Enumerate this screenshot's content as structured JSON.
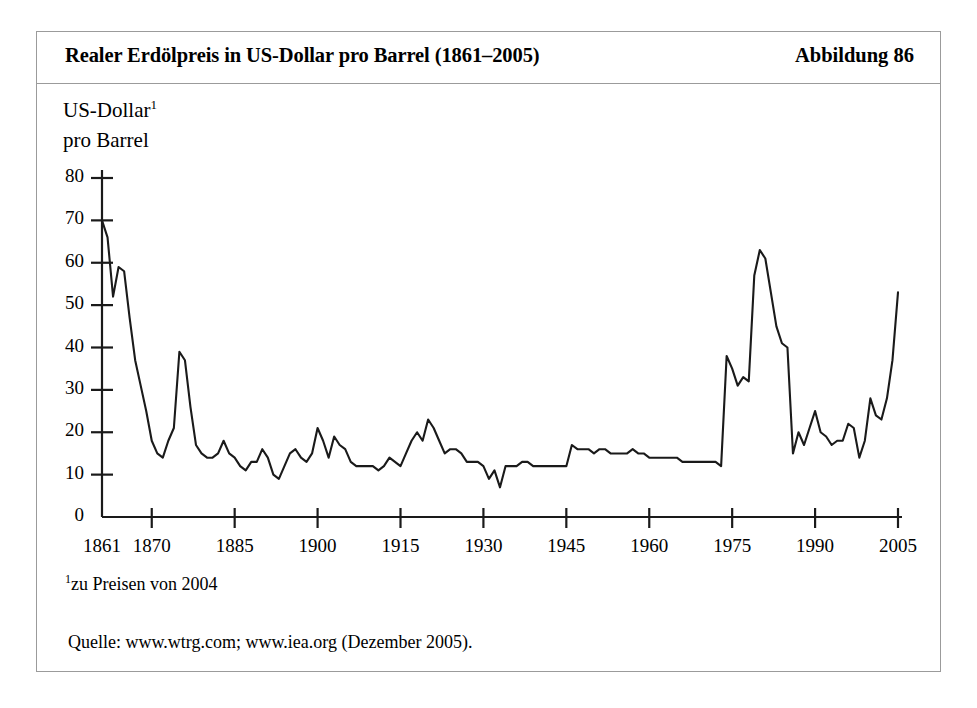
{
  "figure": {
    "title": "Realer Erdölpreis in US-Dollar pro Barrel (1861–2005)",
    "number": "Abbildung 86",
    "axis_title_line1": "US-Dollar",
    "axis_title_sup": "1",
    "axis_title_line2": "pro Barrel",
    "footnote_marker": "1",
    "footnote_text": "zu Preisen von 2004",
    "source": "Quelle: www.wtrg.com; www.iea.org (Dezember 2005).",
    "frame_color": "#9b9b9b",
    "line_color": "#1a1a1a",
    "background": "#ffffff"
  },
  "chart_data": {
    "type": "line",
    "title": "Realer Erdölpreis in US-Dollar pro Barrel (1861–2005)",
    "xlabel": "",
    "ylabel": "US-Dollar pro Barrel",
    "xlim": [
      1861,
      2005
    ],
    "ylim": [
      0,
      80
    ],
    "grid": false,
    "legend": null,
    "ytick_labels": [
      "80",
      "70",
      "60",
      "50",
      "40",
      "30",
      "20",
      "10",
      "0"
    ],
    "ytick_values": [
      80,
      70,
      60,
      50,
      40,
      30,
      20,
      10,
      0
    ],
    "xtick_labels": [
      "1861",
      "1870",
      "1885",
      "1900",
      "1915",
      "1930",
      "1945",
      "1960",
      "1975",
      "1990",
      "2005"
    ],
    "xtick_values": [
      1861,
      1870,
      1885,
      1900,
      1915,
      1930,
      1945,
      1960,
      1975,
      1990,
      2005
    ],
    "series": [
      {
        "name": "Realer Erdölpreis (US-Dollar pro Barrel, Preise von 2004)",
        "x": [
          1861,
          1862,
          1863,
          1864,
          1865,
          1866,
          1867,
          1868,
          1869,
          1870,
          1871,
          1872,
          1873,
          1874,
          1875,
          1876,
          1877,
          1878,
          1879,
          1880,
          1881,
          1882,
          1883,
          1884,
          1885,
          1886,
          1887,
          1888,
          1889,
          1890,
          1891,
          1892,
          1893,
          1894,
          1895,
          1896,
          1897,
          1898,
          1899,
          1900,
          1901,
          1902,
          1903,
          1904,
          1905,
          1906,
          1907,
          1908,
          1909,
          1910,
          1911,
          1912,
          1913,
          1914,
          1915,
          1916,
          1917,
          1918,
          1919,
          1920,
          1921,
          1922,
          1923,
          1924,
          1925,
          1926,
          1927,
          1928,
          1929,
          1930,
          1931,
          1932,
          1933,
          1934,
          1935,
          1936,
          1937,
          1938,
          1939,
          1940,
          1941,
          1942,
          1943,
          1944,
          1945,
          1946,
          1947,
          1948,
          1949,
          1950,
          1951,
          1952,
          1953,
          1954,
          1955,
          1956,
          1957,
          1958,
          1959,
          1960,
          1961,
          1962,
          1963,
          1964,
          1965,
          1966,
          1967,
          1968,
          1969,
          1970,
          1971,
          1972,
          1973,
          1974,
          1975,
          1976,
          1977,
          1978,
          1979,
          1980,
          1981,
          1982,
          1983,
          1984,
          1985,
          1986,
          1987,
          1988,
          1989,
          1990,
          1991,
          1992,
          1993,
          1994,
          1995,
          1996,
          1997,
          1998,
          1999,
          2000,
          2001,
          2002,
          2003,
          2004,
          2005
        ],
        "y": [
          70,
          66,
          52,
          59,
          58,
          47,
          37,
          31,
          25,
          18,
          15,
          14,
          18,
          21,
          39,
          37,
          26,
          17,
          15,
          14,
          14,
          15,
          18,
          15,
          14,
          12,
          11,
          13,
          13,
          16,
          14,
          10,
          9,
          12,
          15,
          16,
          14,
          13,
          15,
          21,
          18,
          14,
          19,
          17,
          16,
          13,
          12,
          12,
          12,
          12,
          11,
          12,
          14,
          13,
          12,
          15,
          18,
          20,
          18,
          23,
          21,
          18,
          15,
          16,
          16,
          15,
          13,
          13,
          13,
          12,
          9,
          11,
          7,
          12,
          12,
          12,
          13,
          13,
          12,
          12,
          12,
          12,
          12,
          12,
          12,
          17,
          16,
          16,
          16,
          15,
          16,
          16,
          15,
          15,
          15,
          15,
          16,
          15,
          15,
          14,
          14,
          14,
          14,
          14,
          14,
          13,
          13,
          13,
          13,
          13,
          13,
          13,
          12,
          38,
          35,
          31,
          33,
          32,
          57,
          63,
          61,
          53,
          45,
          41,
          40,
          15,
          20,
          17,
          21,
          25,
          20,
          19,
          17,
          18,
          18,
          22,
          21,
          14,
          18,
          28,
          24,
          23,
          28,
          37,
          53
        ]
      }
    ],
    "annotations": [
      {
        "text": "1zu Preisen von 2004"
      },
      {
        "text": "Quelle: www.wtrg.com; www.iea.org (Dezember 2005)."
      }
    ]
  }
}
